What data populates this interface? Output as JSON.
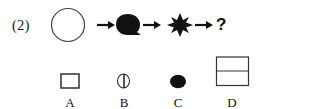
{
  "question": {
    "number_label": "(2)",
    "sequence": [
      {
        "shape": "circle-outline-icon"
      },
      {
        "shape": "speech-bubble-filled-icon"
      },
      {
        "shape": "eight-point-star-filled-icon"
      },
      {
        "shape": "question-mark",
        "text": "?"
      }
    ],
    "arrows": 3,
    "missing_text": "?"
  },
  "options": [
    {
      "label": "A",
      "shape": "square-outline-icon"
    },
    {
      "label": "B",
      "shape": "circle-with-vertical-line-icon"
    },
    {
      "label": "C",
      "shape": "filled-ellipse-icon"
    },
    {
      "label": "D",
      "shape": "rectangle-split-horizontal-icon"
    }
  ],
  "colors": {
    "ink": "#111111",
    "background": "#ffffff"
  }
}
